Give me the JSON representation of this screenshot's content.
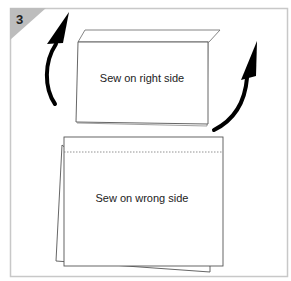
{
  "diagram": {
    "step_number": "3",
    "top_panel": {
      "label": "Sew on right side"
    },
    "bottom_panel": {
      "label": "Sew on wrong side"
    },
    "arrows": [
      {
        "name": "left-arrow",
        "direction": "up"
      },
      {
        "name": "right-arrow",
        "direction": "up"
      }
    ],
    "colors": {
      "frame": "#c8c8c8",
      "step_badge": "#bdbdbd",
      "outline": "#555555",
      "arrow": "#000000",
      "stitch": "#777777"
    }
  }
}
